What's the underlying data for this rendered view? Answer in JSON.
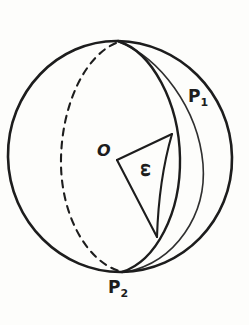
{
  "figure": {
    "background_color": "#fdfdfb",
    "ink_color": "#1d1d1d",
    "labels": {
      "origin": "O",
      "pole_top_base": "P",
      "pole_top_sub": "1",
      "pole_bottom_base": "P",
      "pole_bottom_sub": "2",
      "angle": "ω"
    },
    "geometry": {
      "sphere": {
        "center_x": 120,
        "center_y": 156,
        "radius_x": 112,
        "radius_y": 116,
        "left_edge_x": 8,
        "right_edge_x": 232,
        "top_edge_y": 40,
        "bottom_edge_y": 272
      },
      "pole_top": {
        "x": 118,
        "y": 41
      },
      "pole_bottom": {
        "x": 122,
        "y": 272
      },
      "front_meridian_bulge_x": 180,
      "hidden_meridian_bulge_x": 61,
      "sector": {
        "vertex_x": 117,
        "vertex_y": 160,
        "upper_radius_end_x": 172,
        "upper_radius_end_y": 134,
        "lower_radius_end_x": 157,
        "lower_radius_end_y": 237
      }
    }
  }
}
